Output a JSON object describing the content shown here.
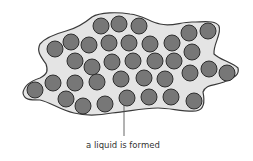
{
  "diagram": {
    "caption": "a liquid is formed",
    "colors": {
      "blob_fill": "#e4e4e4",
      "blob_stroke": "#3a3a3a",
      "particle_fill": "#777777",
      "particle_stroke": "#2e2e2e",
      "leader_line": "#555555",
      "text": "#333333"
    },
    "particle_radius": 8,
    "particles": [
      [
        101,
        26
      ],
      [
        119,
        24
      ],
      [
        139,
        26
      ],
      [
        189,
        33
      ],
      [
        208,
        31
      ],
      [
        55,
        49
      ],
      [
        71,
        42
      ],
      [
        89,
        45
      ],
      [
        109,
        43
      ],
      [
        129,
        43
      ],
      [
        150,
        44
      ],
      [
        172,
        43
      ],
      [
        192,
        52
      ],
      [
        75,
        61
      ],
      [
        92,
        67
      ],
      [
        112,
        62
      ],
      [
        133,
        61
      ],
      [
        155,
        61
      ],
      [
        174,
        61
      ],
      [
        209,
        69
      ],
      [
        227,
        73
      ],
      [
        53,
        83
      ],
      [
        75,
        83
      ],
      [
        97,
        82
      ],
      [
        121,
        79
      ],
      [
        144,
        78
      ],
      [
        165,
        79
      ],
      [
        190,
        73
      ],
      [
        35,
        90
      ],
      [
        66,
        99
      ],
      [
        83,
        106
      ],
      [
        105,
        104
      ],
      [
        127,
        98
      ],
      [
        149,
        97
      ],
      [
        171,
        97
      ],
      [
        194,
        101
      ]
    ]
  }
}
